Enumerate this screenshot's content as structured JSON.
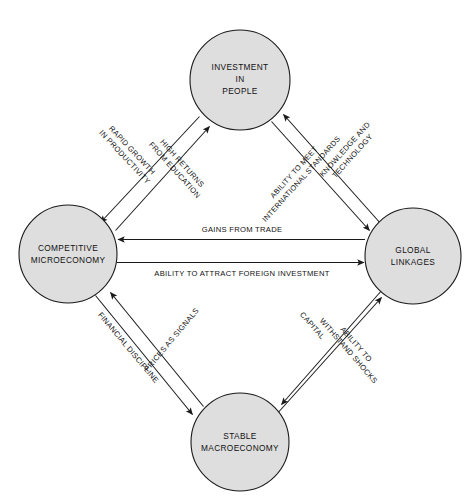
{
  "diagram": {
    "background_color": "#ffffff",
    "node_fill_color": "#dedede",
    "node_stroke_color": "#1a1a1a",
    "text_color": "#111111",
    "nodes": [
      {
        "id": "investment-in-people",
        "lines": [
          "INVESTMENT",
          "IN",
          "PEOPLE"
        ],
        "cx": 240,
        "cy": 80,
        "r": 50
      },
      {
        "id": "competitive-microeconomy",
        "lines": [
          "COMPETITIVE",
          "MICROECONOMY"
        ],
        "cx": 68,
        "cy": 254,
        "r": 49
      },
      {
        "id": "global-linkages",
        "lines": [
          "GLOBAL",
          "LINKAGES"
        ],
        "cx": 413,
        "cy": 256,
        "r": 48
      },
      {
        "id": "stable-macroeconomy",
        "lines": [
          "STABLE",
          "MACROECONOMY"
        ],
        "cx": 240,
        "cy": 442,
        "r": 49
      }
    ],
    "edges": [
      {
        "id": "rapid-growth-in-productivity",
        "lines": [
          "RAPID GROWTH",
          "IN PRODUCTIVITY"
        ],
        "from": "investment-in-people",
        "to": "competitive-microeconomy",
        "direction": "down-left"
      },
      {
        "id": "high-returns-from-education",
        "lines": [
          "HIGH RETURNS",
          "FROM EDUCATION"
        ],
        "from": "competitive-microeconomy",
        "to": "investment-in-people",
        "direction": "up-right"
      },
      {
        "id": "knowledge-and-technology",
        "lines": [
          "KNOWLEDGE AND",
          "TECHNOLOGY"
        ],
        "from": "global-linkages",
        "to": "investment-in-people",
        "direction": "up-left"
      },
      {
        "id": "ability-to-meet-international-standards",
        "lines": [
          "ABILITY TO MEET",
          "INTERNATIONAL STANDARDS"
        ],
        "from": "investment-in-people",
        "to": "global-linkages",
        "direction": "down-right"
      },
      {
        "id": "gains-from-trade",
        "lines": [
          "GAINS FROM TRADE"
        ],
        "from": "global-linkages",
        "to": "competitive-microeconomy",
        "direction": "left"
      },
      {
        "id": "ability-to-attract-foreign-investment",
        "lines": [
          "ABILITY TO ATTRACT FOREIGN INVESTMENT"
        ],
        "from": "competitive-microeconomy",
        "to": "global-linkages",
        "direction": "right"
      },
      {
        "id": "prices-as-signals",
        "lines": [
          "PRICES AS SIGNALS"
        ],
        "from": "stable-macroeconomy",
        "to": "competitive-microeconomy",
        "direction": "up-left"
      },
      {
        "id": "financial-discipline",
        "lines": [
          "FINANCIAL DISCIPLINE"
        ],
        "from": "competitive-microeconomy",
        "to": "stable-macroeconomy",
        "direction": "down-right"
      },
      {
        "id": "capital",
        "lines": [
          "CAPITAL"
        ],
        "from": "global-linkages",
        "to": "stable-macroeconomy",
        "direction": "down-left"
      },
      {
        "id": "ability-to-withstand-shocks",
        "lines": [
          "ABILITY TO",
          "WITHSTAND SHOCKS"
        ],
        "from": "stable-macroeconomy",
        "to": "global-linkages",
        "direction": "up-right"
      }
    ]
  }
}
